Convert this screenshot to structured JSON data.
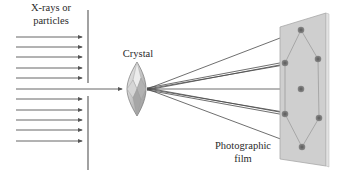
{
  "labels": {
    "source_line1": "X-rays or",
    "source_line2": "particles",
    "crystal": "Crystal",
    "film_line1": "Photographic",
    "film_line2": "film"
  },
  "colors": {
    "background": "#ffffff",
    "line": "#555555",
    "film_fill": "#cfcfcf",
    "film_edge": "#a8a8a8",
    "spot": "#6e6e6e",
    "crystal_light": "#e4e4e4",
    "crystal_dark": "#9a9a9a"
  },
  "diagram": {
    "incident_arrows_y": [
      37,
      47,
      57,
      68,
      78,
      99,
      110,
      120,
      130,
      141
    ],
    "central_beam_y": 89,
    "barrier_x": 88,
    "crystal_center": [
      137,
      89
    ],
    "diffraction_origin": [
      147,
      89
    ],
    "film_corners": [
      [
        280,
        27
      ],
      [
        326,
        13
      ],
      [
        326,
        166
      ],
      [
        280,
        159
      ]
    ],
    "spots": [
      {
        "name": "top",
        "x": 301,
        "y": 30
      },
      {
        "name": "upper-right",
        "x": 318,
        "y": 59
      },
      {
        "name": "upper-left",
        "x": 285,
        "y": 63
      },
      {
        "name": "center",
        "x": 301,
        "y": 89
      },
      {
        "name": "lower-left",
        "x": 285,
        "y": 114
      },
      {
        "name": "lower-right",
        "x": 319,
        "y": 118
      },
      {
        "name": "bottom",
        "x": 302,
        "y": 147
      }
    ]
  }
}
